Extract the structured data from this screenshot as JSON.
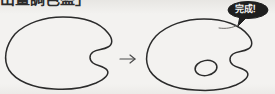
{
  "page": {
    "background_color": "#f3f2f0",
    "ink_color": "#2b2b2b",
    "width": 275,
    "height": 94
  },
  "caption": {
    "text": "出畫調色盤」",
    "note_clipped": "top of line cut off at image edge"
  },
  "badge": {
    "label": "完成！",
    "fill_color": "#1f1f1f",
    "text_color": "#f5f4f2",
    "shape": "speech-bubble",
    "tail_direction": "down-left"
  },
  "steps": [
    {
      "index": 1,
      "name": "palette-outline",
      "description": "Artist palette outline with thumb notch on right side",
      "has_thumb_hole": false
    },
    {
      "index": 2,
      "name": "palette-with-thumb-hole",
      "description": "Same palette outline with small oval thumb hole added",
      "has_thumb_hole": true
    }
  ],
  "arrow": {
    "glyph": "→",
    "label": "step-arrow",
    "direction": "right"
  }
}
